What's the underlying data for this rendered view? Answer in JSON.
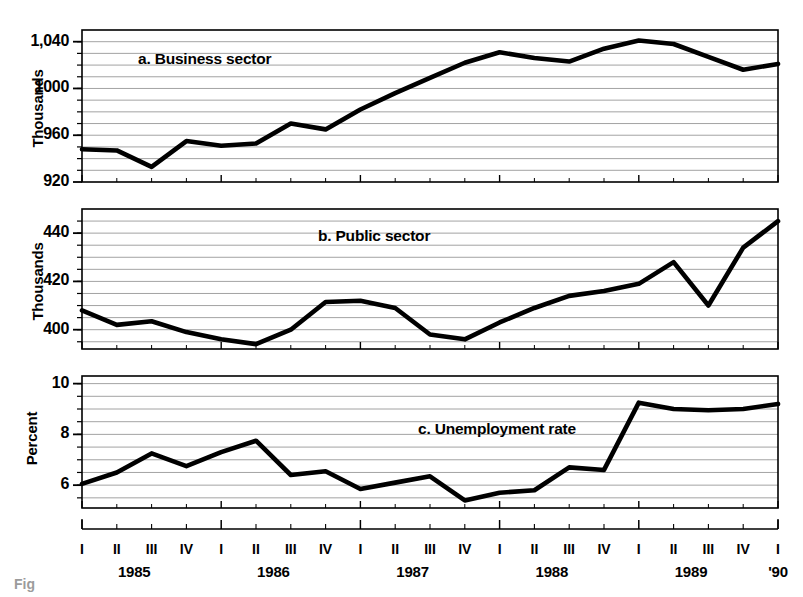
{
  "figure": {
    "background": "#ffffff",
    "line_color": "#000000",
    "grid_color": "#8c8c8c",
    "frame_color": "#000000",
    "caption_fragment": "Fig"
  },
  "xaxis": {
    "quarter_labels": [
      "I",
      "II",
      "III",
      "IV",
      "I",
      "II",
      "III",
      "IV",
      "I",
      "II",
      "III",
      "IV",
      "I",
      "II",
      "III",
      "IV",
      "I",
      "II",
      "III",
      "IV",
      "I"
    ],
    "year_labels": [
      "1985",
      "1986",
      "1987",
      "1988",
      "1989",
      "'90"
    ],
    "year_label_positions": [
      1.5,
      5.5,
      9.5,
      13.5,
      17.5,
      20.0
    ]
  },
  "chart_data": [
    {
      "type": "line",
      "title": "a.  Business sector",
      "ylabel": "Thousands",
      "xlabel": "",
      "ylim": [
        920,
        1050
      ],
      "yticks": [
        920,
        960,
        1000,
        1040
      ],
      "ytick_labels": [
        "920",
        "960",
        "1000",
        "1,040"
      ],
      "gridlines": [
        930,
        940,
        950,
        960,
        970,
        980,
        990,
        1000,
        1010,
        1020,
        1030,
        1040
      ],
      "grid": true,
      "legend": "none",
      "x": [
        "1985 I",
        "1985 II",
        "1985 III",
        "1985 IV",
        "1986 I",
        "1986 II",
        "1986 III",
        "1986 IV",
        "1987 I",
        "1987 II",
        "1987 III",
        "1987 IV",
        "1988 I",
        "1988 II",
        "1988 III",
        "1988 IV",
        "1989 I",
        "1989 II",
        "1989 III",
        "1989 IV",
        "1990 I"
      ],
      "categories": [
        "I",
        "II",
        "III",
        "IV",
        "I",
        "II",
        "III",
        "IV",
        "I",
        "II",
        "III",
        "IV",
        "I",
        "II",
        "III",
        "IV",
        "I",
        "II",
        "III",
        "IV",
        "I"
      ],
      "values": [
        948,
        947,
        933,
        955,
        951,
        953,
        970,
        965,
        982,
        996,
        1009,
        1022,
        1031,
        1026,
        1023,
        1034,
        1041,
        1038,
        1027,
        1016,
        1021
      ]
    },
    {
      "type": "line",
      "title": "b.  Public sector",
      "ylabel": "Thousands",
      "xlabel": "",
      "ylim": [
        392,
        450
      ],
      "yticks": [
        400,
        420,
        440
      ],
      "ytick_labels": [
        "400",
        "420",
        "440"
      ],
      "gridlines": [
        395,
        400,
        405,
        410,
        415,
        420,
        425,
        430,
        435,
        440,
        445
      ],
      "grid": true,
      "legend": "none",
      "x": [
        "1985 I",
        "1985 II",
        "1985 III",
        "1985 IV",
        "1986 I",
        "1986 II",
        "1986 III",
        "1986 IV",
        "1987 I",
        "1987 II",
        "1987 III",
        "1987 IV",
        "1988 I",
        "1988 II",
        "1988 III",
        "1988 IV",
        "1989 I",
        "1989 II",
        "1989 III",
        "1989 IV",
        "1990 I"
      ],
      "categories": [
        "I",
        "II",
        "III",
        "IV",
        "I",
        "II",
        "III",
        "IV",
        "I",
        "II",
        "III",
        "IV",
        "I",
        "II",
        "III",
        "IV",
        "I",
        "II",
        "III",
        "IV",
        "I"
      ],
      "values": [
        408,
        402,
        403.5,
        399,
        396,
        394,
        400,
        411.5,
        412,
        409,
        398,
        396,
        403,
        409,
        414,
        416,
        419,
        428,
        410,
        434,
        445,
        437
      ]
    },
    {
      "type": "line",
      "title": "c.  Unemployment rate",
      "ylabel": "Percent",
      "xlabel": "",
      "ylim": [
        5.1,
        10.3
      ],
      "yticks": [
        6,
        8,
        10
      ],
      "ytick_labels": [
        "6",
        "8",
        "10"
      ],
      "gridlines": [
        5.5,
        6,
        6.5,
        7,
        7.5,
        8,
        8.5,
        9,
        9.5,
        10
      ],
      "grid": true,
      "legend": "none",
      "x": [
        "1985 I",
        "1985 II",
        "1985 III",
        "1985 IV",
        "1986 I",
        "1986 II",
        "1986 III",
        "1986 IV",
        "1987 I",
        "1987 II",
        "1987 III",
        "1987 IV",
        "1988 I",
        "1988 II",
        "1988 III",
        "1988 IV",
        "1989 I",
        "1989 II",
        "1989 III",
        "1989 IV",
        "1990 I"
      ],
      "categories": [
        "I",
        "II",
        "III",
        "IV",
        "I",
        "II",
        "III",
        "IV",
        "I",
        "II",
        "III",
        "IV",
        "I",
        "II",
        "III",
        "IV",
        "I",
        "II",
        "III",
        "IV",
        "I"
      ],
      "values": [
        6.05,
        6.5,
        7.25,
        6.75,
        7.3,
        7.75,
        6.4,
        6.55,
        5.85,
        6.1,
        6.35,
        5.4,
        5.7,
        5.8,
        6.7,
        6.6,
        9.25,
        9.0,
        8.95,
        9.0,
        9.2
      ]
    }
  ]
}
